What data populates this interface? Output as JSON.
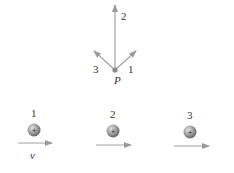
{
  "point": {
    "label": "P",
    "x": 115,
    "y": 70
  },
  "field_arrows": [
    {
      "label": "1",
      "tip_x": 136,
      "tip_y": 51,
      "label_x": 128,
      "label_y": 73
    },
    {
      "label": "2",
      "tip_x": 115,
      "tip_y": 5,
      "label_x": 121,
      "label_y": 20
    },
    {
      "label": "3",
      "tip_x": 94,
      "tip_y": 51,
      "label_x": 93,
      "label_y": 73
    }
  ],
  "charges": [
    {
      "label": "1",
      "sign": "+",
      "cx": 34,
      "cy": 130,
      "arrow_x1": 18,
      "arrow_x2": 52,
      "arrow_y": 143
    },
    {
      "label": "2",
      "sign": "+",
      "cx": 113,
      "cy": 131,
      "arrow_x1": 96,
      "arrow_x2": 131,
      "arrow_y": 145
    },
    {
      "label": "3",
      "sign": "+",
      "cx": 190,
      "cy": 132,
      "arrow_x1": 174,
      "arrow_x2": 209,
      "arrow_y": 146
    }
  ],
  "velocity_label": "v",
  "colors": {
    "arrow": "#9a9a9a",
    "sphere_light": "#d8d8d8",
    "sphere_dark": "#6e6e6e",
    "text": "#333333"
  }
}
